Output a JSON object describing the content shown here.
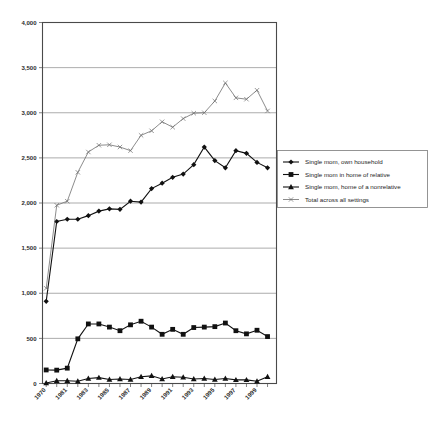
{
  "chart_data": {
    "type": "line",
    "title": "",
    "xlabel": "",
    "ylabel": "",
    "ylim": [
      0,
      4000
    ],
    "ytick_labels": [
      "4,000",
      "3,500",
      "3,000",
      "2,500",
      "2,000",
      "1,500",
      "1,000",
      "500",
      "0"
    ],
    "ytick_values": [
      4000,
      3500,
      3000,
      2500,
      2000,
      1500,
      1000,
      500,
      0
    ],
    "grid": true,
    "legend_position": "right",
    "x": [
      1970,
      1980,
      1981,
      1982,
      1983,
      1984,
      1985,
      1986,
      1987,
      1988,
      1989,
      1990,
      1991,
      1992,
      1993,
      1994,
      1995,
      1996,
      1997,
      1998,
      1999,
      2000
    ],
    "xtick_labels": [
      "1970",
      "1981",
      "1983",
      "1985",
      "1987",
      "1989",
      "1991",
      "1993",
      "1995",
      "1997",
      "1999"
    ],
    "xtick_label_values": [
      1970,
      1981,
      1983,
      1985,
      1987,
      1989,
      1991,
      1993,
      1995,
      1997,
      1999
    ],
    "series": [
      {
        "name": "Single mom, own household",
        "marker": "diamond",
        "color": "#111111",
        "values": [
          910,
          1795,
          1820,
          1820,
          1860,
          1910,
          1935,
          1930,
          2020,
          2010,
          2160,
          2220,
          2285,
          2320,
          2425,
          2620,
          2470,
          2390,
          2580,
          2550,
          2450,
          2390
        ]
      },
      {
        "name": "Single mom in home of relative",
        "marker": "square",
        "color": "#111111",
        "values": [
          150,
          148,
          170,
          495,
          660,
          660,
          625,
          585,
          650,
          690,
          625,
          545,
          600,
          545,
          620,
          625,
          630,
          670,
          585,
          550,
          590,
          520
        ]
      },
      {
        "name": "Single mom, home of a nonrelative",
        "marker": "triangle",
        "color": "#111111",
        "values": [
          5,
          30,
          30,
          25,
          55,
          65,
          45,
          50,
          45,
          75,
          85,
          50,
          75,
          70,
          50,
          55,
          45,
          55,
          40,
          40,
          25,
          75
        ]
      },
      {
        "name": "Total across all settings",
        "marker": "x",
        "color": "#6e6e6e",
        "values": [
          1055,
          1975,
          2020,
          2340,
          2565,
          2640,
          2645,
          2620,
          2580,
          2750,
          2800,
          2900,
          2840,
          2935,
          2995,
          3000,
          3130,
          3330,
          3165,
          3150,
          3250,
          3020
        ]
      }
    ]
  },
  "legend": {
    "items": [
      {
        "label": "Single mom, own household",
        "marker": "diamond"
      },
      {
        "label": "Single mom in home of relative",
        "marker": "square"
      },
      {
        "label": "Single mom, home of a nonrelative",
        "marker": "triangle"
      },
      {
        "label": "Total across all settings",
        "marker": "x"
      }
    ]
  }
}
